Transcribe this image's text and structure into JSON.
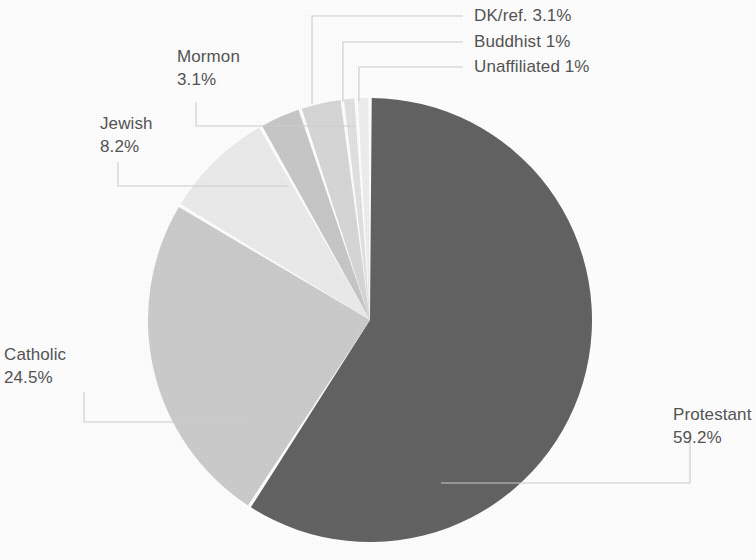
{
  "chart_data": {
    "type": "pie",
    "title": "",
    "subtitle": "",
    "xlabel": "",
    "ylabel": "",
    "legend_position": "none",
    "grid": false,
    "labels_show_percent": true,
    "start_angle_deg": 0,
    "direction": "clockwise",
    "categories": [
      "Protestant",
      "Catholic",
      "Jewish",
      "Mormon",
      "DK/ref.",
      "Buddhist",
      "Unaffiliated"
    ],
    "values": [
      59.2,
      24.5,
      8.2,
      3.1,
      3.1,
      1,
      1
    ],
    "value_labels": [
      "59.2%",
      "24.5%",
      "8.2%",
      "3.1%",
      "3.1%",
      "1%",
      "1%"
    ],
    "colors": [
      "#636363",
      "#cdcdcd",
      "#ececec",
      "#c8c8c8",
      "#d8d8d8",
      "#e2e2e2",
      "#efefef"
    ],
    "slices": [
      {
        "name": "Protestant",
        "value": 59.2,
        "value_label": "59.2%",
        "color": "#636363"
      },
      {
        "name": "Catholic",
        "value": 24.5,
        "value_label": "24.5%",
        "color": "#cdcdcd"
      },
      {
        "name": "Jewish",
        "value": 8.2,
        "value_label": "8.2%",
        "color": "#ececec"
      },
      {
        "name": "Mormon",
        "value": 3.1,
        "value_label": "3.1%",
        "color": "#c8c8c8"
      },
      {
        "name": "DK/ref.",
        "value": 3.1,
        "value_label": "3.1%",
        "color": "#d8d8d8"
      },
      {
        "name": "Buddhist",
        "value": 1,
        "value_label": "1%",
        "color": "#e2e2e2"
      },
      {
        "name": "Unaffiliated",
        "value": 1,
        "value_label": "1%",
        "color": "#efefef"
      }
    ]
  },
  "labels": {
    "protestant": {
      "name": "Protestant",
      "pct": "59.2%",
      "full": "Protestant 59.2%"
    },
    "catholic": {
      "name": "Catholic",
      "pct": "24.5%",
      "full": "Catholic 24.5%"
    },
    "jewish": {
      "name": "Jewish",
      "pct": "8.2%",
      "full": "Jewish 8.2%"
    },
    "mormon": {
      "name": "Mormon",
      "pct": "3.1%",
      "full": "Mormon 3.1%"
    },
    "dkref": {
      "name": "DK/ref.",
      "pct": "3.1%",
      "full": "DK/ref. 3.1%"
    },
    "buddhist": {
      "name": "Buddhist",
      "pct": "1%",
      "full": "Buddhist 1%"
    },
    "unaffiliated": {
      "name": "Unaffiliated",
      "pct": "1%",
      "full": "Unaffiliated 1%"
    }
  },
  "style": {
    "background": "#ffffff",
    "text_color": "#555555",
    "leader_color": "#cfcfcf"
  }
}
